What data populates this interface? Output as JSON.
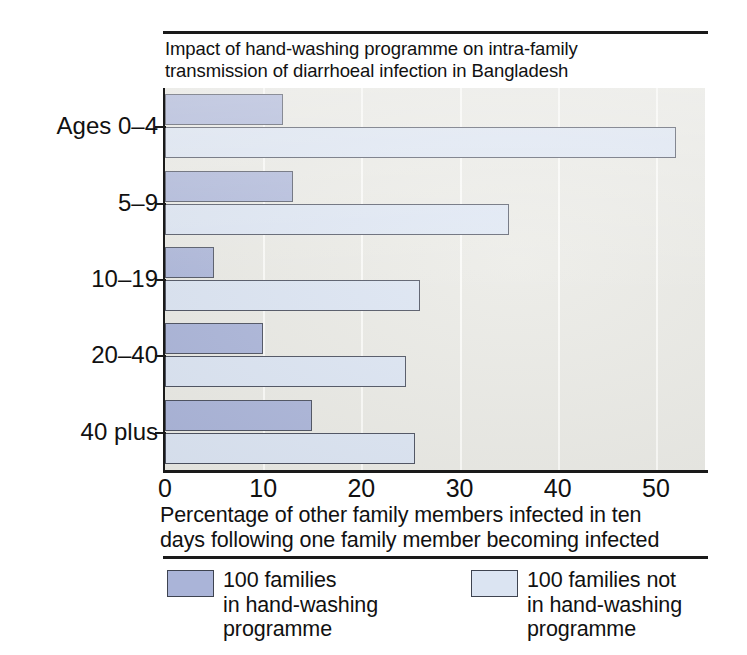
{
  "chart_data": {
    "type": "bar",
    "orientation": "horizontal",
    "title": "Impact of hand-washing programme on intra-family\ntransmission of diarrhoeal infection in Bangladesh",
    "xlabel": "Percentage of other family members infected in ten\ndays following one family member becoming infected",
    "ylabel": "",
    "categories": [
      "Ages 0–4",
      "5–9",
      "10–19",
      "20–40",
      "40 plus"
    ],
    "series": [
      {
        "name": "100 families\nin hand-washing\nprogramme",
        "color": "#aab4d8",
        "values": [
          12,
          13,
          5,
          10,
          15
        ]
      },
      {
        "name": "100 families not\nin hand-washing\nprogramme",
        "color": "#dbe4f2",
        "values": [
          52,
          35,
          26,
          24.5,
          25.5
        ]
      }
    ],
    "xlim": [
      0,
      55
    ],
    "xticks": [
      0,
      10,
      20,
      30,
      40,
      50
    ],
    "xtick_labels": [
      "0",
      "10",
      "20",
      "30",
      "40",
      "50"
    ],
    "gridlines": {
      "axis": "x",
      "visible": true,
      "color": "#fbfbf8"
    },
    "legend": {
      "position": "bottom",
      "entries": [
        "100 families\nin hand-washing\nprogramme",
        "100 families not\nin hand-washing\nprogramme"
      ]
    },
    "plot_background": "#e9e9e4",
    "page_background": "#ffffff",
    "bar_border_color": "#4a4f5e"
  }
}
